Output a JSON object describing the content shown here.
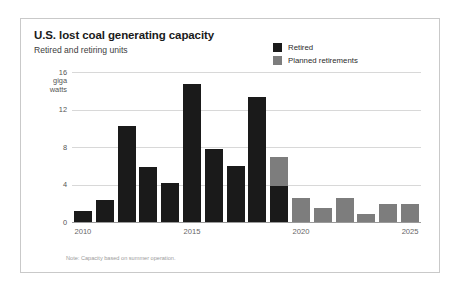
{
  "chart_data": {
    "type": "bar",
    "title": "U.S. lost coal generating capacity",
    "subtitle": "Retired and retiring units",
    "xlabel": "",
    "ylabel": "giga watts",
    "ylim": [
      0,
      16
    ],
    "yticks": [
      0,
      4,
      8,
      12,
      16
    ],
    "ytick_labels": [
      "0",
      "4",
      "8",
      "12",
      "16"
    ],
    "y_unit_label_line1": "giga",
    "y_unit_label_line2": "watts",
    "grid": true,
    "stacked": true,
    "legend_position": "top-right",
    "categories": [
      2010,
      2011,
      2012,
      2013,
      2014,
      2015,
      2016,
      2017,
      2018,
      2019,
      2020,
      2021,
      2022,
      2023,
      2024,
      2025
    ],
    "xtick_labels": [
      "2010",
      "2015",
      "2020",
      "2025"
    ],
    "xticks": [
      2010,
      2015,
      2020,
      2025
    ],
    "series": [
      {
        "name": "Retired",
        "color": "#1a1a1a",
        "values": [
          1.3,
          2.5,
          10.4,
          6.0,
          4.3,
          14.8,
          7.9,
          6.1,
          13.4,
          3.9,
          0,
          0,
          0,
          0,
          0,
          0
        ]
      },
      {
        "name": "Planned retirements",
        "color": "#7d7d7d",
        "values": [
          0,
          0,
          0,
          0,
          0,
          0,
          0,
          0,
          0,
          3.1,
          2.7,
          1.6,
          2.7,
          1.0,
          2.0,
          2.0
        ]
      }
    ],
    "annotations": [
      "Note: Capacity based on summer operation."
    ]
  },
  "legend": {
    "items": [
      {
        "label": "Retired",
        "color": "#1a1a1a"
      },
      {
        "label": "Planned retirements",
        "color": "#7d7d7d"
      }
    ]
  },
  "note": "Note: Capacity based on summer operation."
}
